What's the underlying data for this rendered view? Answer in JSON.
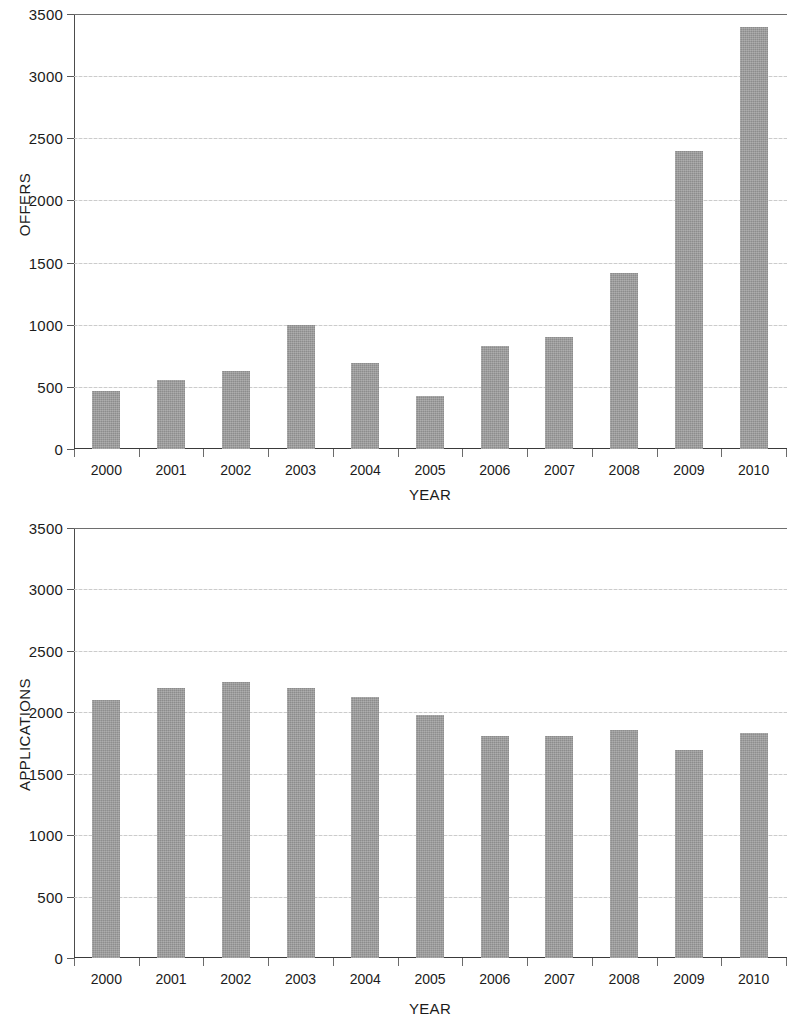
{
  "chart_data": [
    {
      "type": "bar",
      "id": "offers",
      "title": "",
      "xlabel": "YEAR",
      "ylabel": "OFFERS",
      "categories": [
        "2000",
        "2001",
        "2002",
        "2003",
        "2004",
        "2005",
        "2006",
        "2007",
        "2008",
        "2009",
        "2010"
      ],
      "values": [
        465,
        555,
        630,
        1000,
        695,
        425,
        825,
        900,
        1415,
        2400,
        3395
      ],
      "ylim": [
        0,
        3500
      ],
      "yticks": [
        0,
        500,
        1000,
        1500,
        2000,
        2500,
        3000,
        3500
      ],
      "ytick_labels": [
        "0",
        "500",
        "1000",
        "1500",
        "2000",
        "2500",
        "3000",
        "3500"
      ],
      "grid": true,
      "legend": false,
      "bar_color": "#9b9b9b"
    },
    {
      "type": "bar",
      "id": "applications",
      "title": "",
      "xlabel": "YEAR",
      "ylabel": "APPLICATIONS",
      "categories": [
        "2000",
        "2001",
        "2002",
        "2003",
        "2004",
        "2005",
        "2006",
        "2007",
        "2008",
        "2009",
        "2010"
      ],
      "values": [
        2100,
        2200,
        2250,
        2200,
        2125,
        1975,
        1805,
        1805,
        1855,
        1690,
        1830
      ],
      "ylim": [
        0,
        3500
      ],
      "yticks": [
        0,
        500,
        1000,
        1500,
        2000,
        2500,
        3000,
        3500
      ],
      "ytick_labels": [
        "0",
        "500",
        "1000",
        "1500",
        "2000",
        "2500",
        "3000",
        "3500"
      ],
      "grid": true,
      "legend": false,
      "bar_color": "#9b9b9b"
    }
  ]
}
